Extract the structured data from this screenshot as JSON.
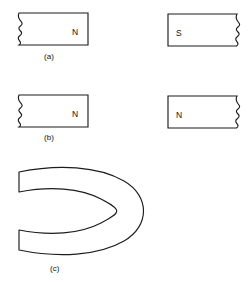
{
  "figure": {
    "background_color": "#ffffff",
    "stroke_color": "#1c1c1c",
    "panels": [
      {
        "id": "a",
        "label": "(a)",
        "label_x": 44,
        "label_y": 53,
        "shapes": [
          {
            "name": "magnet-a-left",
            "pole": "N",
            "pole_x": 72,
            "pole_y": 28,
            "jagged_edge": "left",
            "x": 18,
            "y": 13,
            "width": 70,
            "height": 32
          },
          {
            "name": "magnet-a-right",
            "pole": "S",
            "pole_x": 176,
            "pole_y": 29,
            "jagged_edge": "right",
            "x": 168,
            "y": 14,
            "width": 70,
            "height": 32
          }
        ]
      },
      {
        "id": "b",
        "label": "(b)",
        "label_x": 44,
        "label_y": 134,
        "shapes": [
          {
            "name": "magnet-b-left",
            "pole": "N",
            "pole_x": 72,
            "pole_y": 110,
            "jagged_edge": "left",
            "x": 18,
            "y": 95,
            "width": 70,
            "height": 32
          },
          {
            "name": "magnet-b-right",
            "pole": "N",
            "pole_x": 176,
            "pole_y": 111,
            "jagged_edge": "right",
            "x": 168,
            "y": 96,
            "width": 70,
            "height": 32
          }
        ]
      },
      {
        "id": "c",
        "label": "(c)",
        "label_x": 50,
        "label_y": 265,
        "shapes": [
          {
            "name": "horseshoe-magnet",
            "pole": "",
            "opening_direction": "left",
            "x": 18,
            "y": 163,
            "width": 127,
            "height": 95
          }
        ]
      }
    ]
  }
}
